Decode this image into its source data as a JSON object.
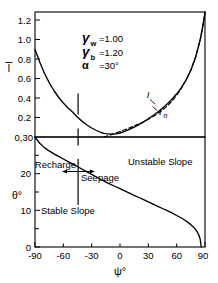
{
  "figure": {
    "xlabel": "ψ°",
    "x_ticks": [
      "-90",
      "-60",
      "-30",
      "0",
      "30",
      "60",
      "90"
    ],
    "x_tick_values": [
      -90,
      -60,
      -30,
      0,
      30,
      60,
      90
    ],
    "xlim": [
      -90,
      90
    ]
  },
  "annotations": {
    "gamma_w_symbol": "γ",
    "gamma_w_sub": "w",
    "gamma_w_eq": "=1.00",
    "gamma_b_symbol": "γ",
    "gamma_b_sub": "b",
    "gamma_b_eq": "=1.20",
    "alpha_symbol": "α",
    "alpha_eq": "=30°",
    "curve_label_I": "I",
    "curve_label_In_base": "I",
    "curve_label_In_sub": "n",
    "recharge": "Recharge",
    "seepage": "Seepage",
    "unstable_slope": "Unstable Slope",
    "stable_slope": "Stable Slope"
  },
  "chart_data": [
    {
      "type": "line",
      "title": "",
      "xlabel": "ψ°",
      "ylabel": "I̅",
      "ylabel_plain": "I",
      "xlim": [
        -90,
        90
      ],
      "ylim": [
        0.3,
        1.3
      ],
      "y_ticks": [
        0.2,
        0.4,
        0.6,
        0.8,
        1.0,
        1.2
      ],
      "y_tick_labels": [
        "0.2",
        "0.4",
        "0.6",
        "0.8",
        "1.0",
        "1.2"
      ],
      "y_baseline_label": "0,30",
      "grid": false,
      "legend": "inline-curve-labels",
      "series": [
        {
          "name": "I",
          "style": "solid",
          "x": [
            -90,
            -85,
            -80,
            -75,
            -70,
            -65,
            -60,
            -55,
            -50,
            -45,
            -40,
            -35,
            -30,
            -25,
            -20,
            -17,
            -15,
            -10,
            -5,
            0,
            5,
            10,
            15,
            20,
            25,
            30,
            35,
            40,
            45,
            50,
            55,
            60,
            65,
            70,
            75,
            80,
            85,
            88,
            90
          ],
          "y": [
            1.0,
            0.9,
            0.81,
            0.735,
            0.672,
            0.618,
            0.572,
            0.532,
            0.498,
            0.458,
            0.425,
            0.396,
            0.372,
            0.352,
            0.336,
            0.3295,
            0.3265,
            0.3225,
            0.3245,
            0.332,
            0.3445,
            0.3605,
            0.379,
            0.3995,
            0.4215,
            0.4455,
            0.4715,
            0.4995,
            0.5305,
            0.5645,
            0.6025,
            0.6455,
            0.6955,
            0.7565,
            0.834,
            0.9375,
            1.08,
            1.2,
            1.3
          ]
        },
        {
          "name": "In",
          "style": "dashed",
          "x": [
            -17,
            -10,
            -5,
            0,
            5,
            10,
            15,
            20,
            25,
            30,
            35,
            40,
            45,
            50,
            55,
            60,
            65,
            70,
            75,
            80,
            85,
            88,
            90
          ],
          "y": [
            0.3,
            0.3175,
            0.3305,
            0.344,
            0.358,
            0.3725,
            0.388,
            0.4045,
            0.4225,
            0.442,
            0.4635,
            0.488,
            0.516,
            0.5485,
            0.587,
            0.6335,
            0.69,
            0.7565,
            0.834,
            0.9375,
            1.08,
            1.2,
            1.3
          ]
        }
      ],
      "markers": [
        {
          "name": "vertical-tick-minimum",
          "x": -17,
          "y": 0.3295
        }
      ]
    },
    {
      "type": "line",
      "title": "",
      "xlabel": "ψ°",
      "ylabel": "θ°",
      "xlim": [
        -90,
        90
      ],
      "ylim": [
        0,
        30
      ],
      "y_ticks": [
        0,
        5,
        10,
        15,
        20,
        25,
        30
      ],
      "y_tick_labels": [
        "0",
        "",
        "10",
        "",
        "20",
        "",
        ""
      ],
      "y_major_labeled": [
        0,
        10,
        20
      ],
      "grid": false,
      "series": [
        {
          "name": "theta",
          "style": "solid",
          "x": [
            -90,
            -85,
            -80,
            -75,
            -70,
            -65,
            -60,
            -55,
            -50,
            -45,
            -40,
            -35,
            -30,
            -25,
            -20,
            -17,
            -15,
            -10,
            -5,
            0,
            5,
            10,
            15,
            20,
            25,
            30,
            35,
            40,
            45,
            50,
            55,
            60,
            65,
            70,
            75,
            78,
            80,
            82,
            84,
            85,
            86
          ],
          "y": [
            30.0,
            28.3,
            27.1,
            26.2,
            25.4,
            24.7,
            24.0,
            23.3,
            22.6,
            21.9,
            21.2,
            20.5,
            19.8,
            19.1,
            18.4,
            18.0,
            17.7,
            17.1,
            16.5,
            15.9,
            15.3,
            14.7,
            14.1,
            13.5,
            12.9,
            12.3,
            11.7,
            11.1,
            10.5,
            9.9,
            9.3,
            8.6,
            7.9,
            7.1,
            6.1,
            5.4,
            4.8,
            4.0,
            2.9,
            2.0,
            0.0
          ]
        }
      ],
      "markers": [
        {
          "name": "vertical-reference-line",
          "x": -17,
          "y_from": 12.0,
          "y_to": 24.5
        }
      ]
    }
  ]
}
